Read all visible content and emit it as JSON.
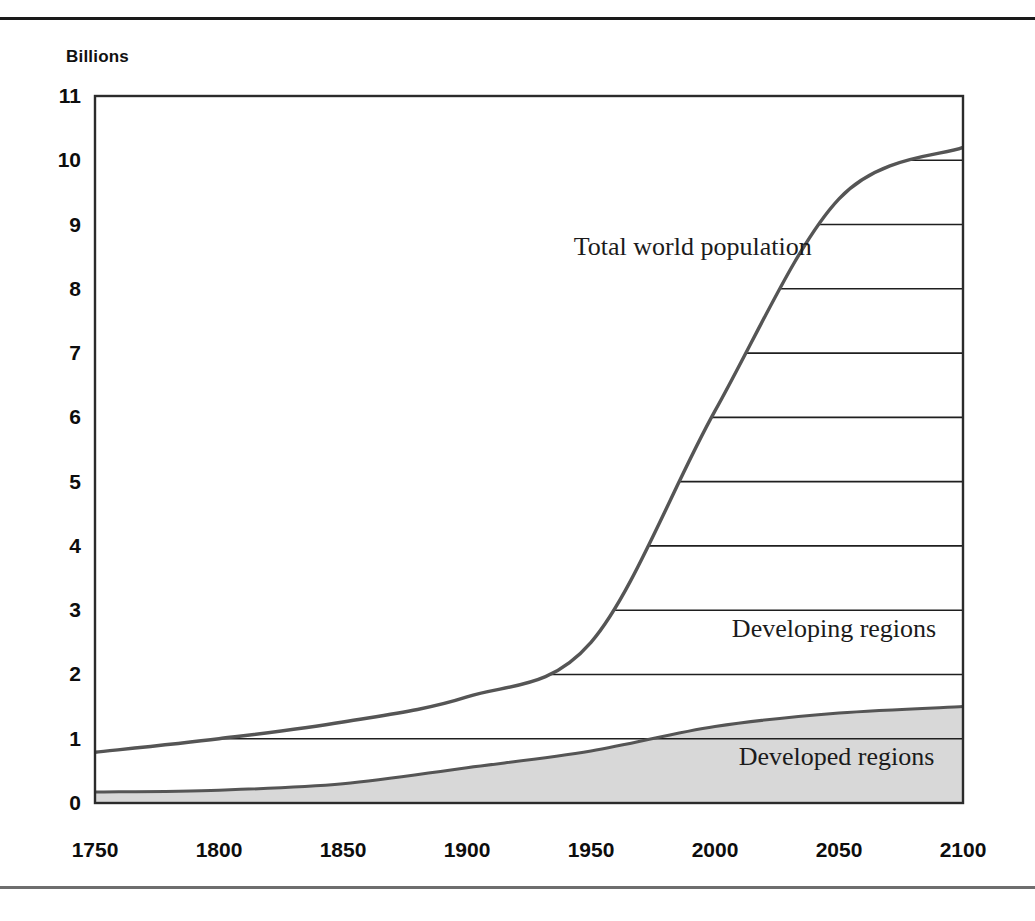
{
  "figure": {
    "unit_label": "Billions"
  },
  "chart_data": {
    "type": "area",
    "title": "",
    "subtitle": "",
    "xlabel": "",
    "ylabel": "Billions",
    "xlim": [
      1750,
      2100
    ],
    "ylim": [
      0,
      11
    ],
    "grid": true,
    "legend_position": "inline-annotations",
    "x_ticks": [
      "1750",
      "1800",
      "1850",
      "1900",
      "1950",
      "2000",
      "2050",
      "2100"
    ],
    "y_ticks": [
      "0",
      "1",
      "2",
      "3",
      "4",
      "5",
      "6",
      "7",
      "8",
      "9",
      "10",
      "11"
    ],
    "x": [
      1750,
      1800,
      1850,
      1900,
      1950,
      2000,
      2050,
      2100
    ],
    "series": [
      {
        "name": "Total world population",
        "values": [
          0.79,
          1.0,
          1.26,
          1.65,
          2.5,
          6.1,
          9.4,
          10.2
        ],
        "style": "line",
        "color": "#555555"
      },
      {
        "name": "Developed regions",
        "values": [
          0.17,
          0.2,
          0.3,
          0.55,
          0.81,
          1.19,
          1.4,
          1.5
        ],
        "style": "filled-area",
        "color": "#d8d8d8"
      },
      {
        "name": "Developing regions",
        "values": [
          0.62,
          0.8,
          0.96,
          1.1,
          1.69,
          4.91,
          8.0,
          8.7
        ],
        "style": "between-areas",
        "color": "#ffffff"
      }
    ],
    "annotations": [
      {
        "text": "Total world population",
        "x": 1991,
        "y": 8.65
      },
      {
        "text": "Developing regions",
        "x": 2048,
        "y": 2.7
      },
      {
        "text": "Developed regions",
        "x": 2049,
        "y": 0.72
      }
    ]
  }
}
